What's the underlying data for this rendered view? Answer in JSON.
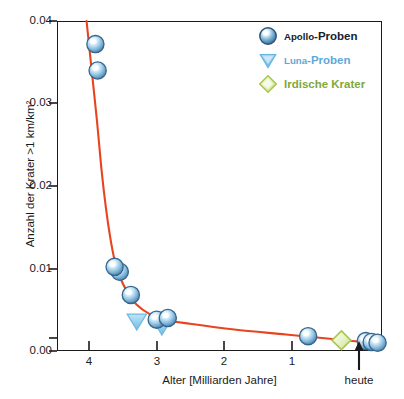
{
  "chart_data": {
    "type": "scatter",
    "title": "",
    "xlabel": "Alter  [Milliarden Jahre]",
    "ylabel": "Anzahl der Krater >1 km/km²",
    "xlim": [
      4.4,
      0.0
    ],
    "ylim": [
      0.0,
      0.04
    ],
    "xticks": [
      4,
      3,
      2,
      1
    ],
    "xticklabels": [
      "4",
      "3",
      "2",
      "1"
    ],
    "x_axis_end_annotation": "heute",
    "yticks": [
      0.0,
      0.01,
      0.02,
      0.03,
      0.04
    ],
    "yticklabels": [
      "0.00",
      "0.01",
      "0.02",
      "0.03",
      "0.04"
    ],
    "grid": false,
    "legend_position": "top-right",
    "axis_direction": "x reversed (oldest on left)",
    "series": [
      {
        "name": "Apollo-Proben",
        "marker": "sphere",
        "color": "#4a7fa8",
        "points": [
          {
            "x": 3.88,
            "y": 0.0372
          },
          {
            "x": 3.85,
            "y": 0.034
          },
          {
            "x": 3.55,
            "y": 0.0096
          },
          {
            "x": 3.62,
            "y": 0.0102
          },
          {
            "x": 3.4,
            "y": 0.0068
          },
          {
            "x": 3.05,
            "y": 0.0038
          },
          {
            "x": 2.9,
            "y": 0.004
          },
          {
            "x": 1.0,
            "y": 0.0018
          },
          {
            "x": 0.22,
            "y": 0.0012
          },
          {
            "x": 0.14,
            "y": 0.0011
          },
          {
            "x": 0.06,
            "y": 0.001
          }
        ]
      },
      {
        "name": "Luna-Proben",
        "marker": "triangle-down",
        "color": "#7cc3e8",
        "points": [
          {
            "x": 3.32,
            "y": 0.0036
          },
          {
            "x": 2.98,
            "y": 0.003
          }
        ]
      },
      {
        "name": "Irdische Krater",
        "marker": "diamond",
        "color": "#a8c84a",
        "points": [
          {
            "x": 0.55,
            "y": 0.0013
          }
        ]
      }
    ],
    "fit_curve": {
      "name": "Kraterproduktionskurve",
      "color": "#e8441e",
      "description": "Exponentieller Abfall der Kraterrate",
      "points": [
        {
          "x": 4.0,
          "y": 0.04
        },
        {
          "x": 3.93,
          "y": 0.034
        },
        {
          "x": 3.86,
          "y": 0.028
        },
        {
          "x": 3.8,
          "y": 0.0222
        },
        {
          "x": 3.74,
          "y": 0.0175
        },
        {
          "x": 3.68,
          "y": 0.0138
        },
        {
          "x": 3.62,
          "y": 0.011
        },
        {
          "x": 3.55,
          "y": 0.009
        },
        {
          "x": 3.45,
          "y": 0.0072
        },
        {
          "x": 3.32,
          "y": 0.0056
        },
        {
          "x": 3.15,
          "y": 0.0045
        },
        {
          "x": 2.95,
          "y": 0.0038
        },
        {
          "x": 2.6,
          "y": 0.0033
        },
        {
          "x": 2.0,
          "y": 0.0026
        },
        {
          "x": 1.3,
          "y": 0.002
        },
        {
          "x": 0.6,
          "y": 0.0014
        },
        {
          "x": 0.05,
          "y": 0.0009
        }
      ]
    },
    "legend": [
      {
        "label_prefix": "Apollo",
        "label_suffix": "-Proben",
        "color": "#15212e",
        "marker": "sphere"
      },
      {
        "label_prefix": "Luna",
        "label_suffix": "-Proben",
        "color": "#5fa8d8",
        "marker": "triangle-down"
      },
      {
        "label_prefix": "Irdische Krater",
        "label_suffix": "",
        "color": "#7fa83c",
        "marker": "diamond"
      }
    ]
  },
  "colors": {
    "curve": "#e8441e",
    "apollo": "#4a7fa8",
    "luna": "#7cc3e8",
    "krater": "#a8c84a",
    "axis": "#1a1a1a",
    "background": "#ffffff"
  }
}
